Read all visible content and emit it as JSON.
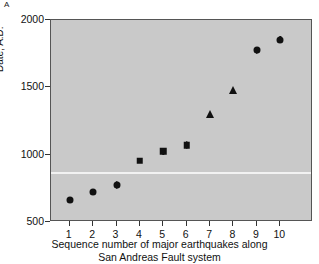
{
  "panel": {
    "label": "A"
  },
  "chart_data": {
    "type": "scatter",
    "title": "",
    "xlabel": "Sequence number of major earthquakes along",
    "xlabel_line2": "San Andreas Fault system",
    "ylabel": "Date, A.D.",
    "xlim": [
      0.2,
      11.4
    ],
    "ylim": [
      500,
      2000
    ],
    "yticks": [
      500,
      1000,
      1500,
      2000
    ],
    "ytick_labels": [
      "500",
      "1000",
      "1500",
      "2000"
    ],
    "xticks": [
      1,
      2,
      3,
      4,
      5,
      6,
      7,
      8,
      9,
      10
    ],
    "xtick_labels": [
      "1",
      "2",
      "3",
      "4",
      "5",
      "6",
      "7",
      "8",
      "9",
      "10"
    ],
    "grid": false,
    "legend": false,
    "plot_background_color": "#c9c9c9",
    "marker_color": "#111111",
    "reference_line": {
      "y": 870,
      "color": "#f2f2f2",
      "orientation": "horizontal"
    },
    "x": [
      1,
      2,
      3,
      4,
      5,
      6,
      7,
      8,
      9,
      10
    ],
    "values": [
      665,
      720,
      775,
      955,
      1025,
      1070,
      1300,
      1480,
      1775,
      1855
    ],
    "markers": [
      "circle",
      "circle",
      "circle",
      "square",
      "square",
      "square",
      "triangle",
      "triangle",
      "circle",
      "circle"
    ],
    "yerr_low": [
      0,
      0,
      30,
      0,
      25,
      30,
      0,
      0,
      25,
      25
    ],
    "yerr_high": [
      0,
      0,
      30,
      0,
      25,
      30,
      0,
      0,
      25,
      25
    ]
  }
}
